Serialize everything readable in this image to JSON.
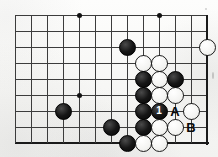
{
  "diagram": {
    "kind": "go-board-problem-diagram",
    "board": {
      "visible_columns": 13,
      "visible_rows": 9,
      "cell_size": 16,
      "origin_x": 15,
      "origin_y": 15,
      "line_color": "#3c3c3c",
      "edge_color": "#1a1a1a",
      "background_color": "#fbfbfa",
      "edges": {
        "bottom_row": 8,
        "right_column": 12
      }
    },
    "star_points": [
      {
        "col": 4,
        "row": 0
      },
      {
        "col": 9,
        "row": 0
      },
      {
        "col": 4,
        "row": 5
      }
    ],
    "stones": [
      {
        "color": "black",
        "col": 7,
        "row": 2,
        "label": ""
      },
      {
        "color": "white",
        "col": 12,
        "row": 2,
        "label": ""
      },
      {
        "color": "white",
        "col": 8,
        "row": 3,
        "label": ""
      },
      {
        "color": "white",
        "col": 9,
        "row": 3,
        "label": ""
      },
      {
        "color": "black",
        "col": 8,
        "row": 4,
        "label": ""
      },
      {
        "color": "white",
        "col": 9,
        "row": 4,
        "label": ""
      },
      {
        "color": "black",
        "col": 10,
        "row": 4,
        "label": ""
      },
      {
        "color": "black",
        "col": 8,
        "row": 5,
        "label": ""
      },
      {
        "color": "white",
        "col": 9,
        "row": 5,
        "label": ""
      },
      {
        "color": "white",
        "col": 10,
        "row": 5,
        "label": ""
      },
      {
        "color": "black",
        "col": 3,
        "row": 6,
        "label": ""
      },
      {
        "color": "black",
        "col": 8,
        "row": 6,
        "label": ""
      },
      {
        "color": "black",
        "col": 9,
        "row": 6,
        "label": "1"
      },
      {
        "color": "white",
        "col": 11,
        "row": 6,
        "label": ""
      },
      {
        "color": "black",
        "col": 6,
        "row": 7,
        "label": ""
      },
      {
        "color": "black",
        "col": 8,
        "row": 7,
        "label": ""
      },
      {
        "color": "white",
        "col": 9,
        "row": 7,
        "label": ""
      },
      {
        "color": "white",
        "col": 10,
        "row": 7,
        "label": ""
      },
      {
        "color": "black",
        "col": 7,
        "row": 8,
        "label": ""
      },
      {
        "color": "white",
        "col": 8,
        "row": 8,
        "label": ""
      },
      {
        "color": "white",
        "col": 9,
        "row": 8,
        "label": ""
      }
    ],
    "point_labels": [
      {
        "text": "A",
        "col": 10,
        "row": 6
      },
      {
        "text": "B",
        "col": 11,
        "row": 7
      }
    ],
    "move_numbers": [
      "1"
    ]
  }
}
